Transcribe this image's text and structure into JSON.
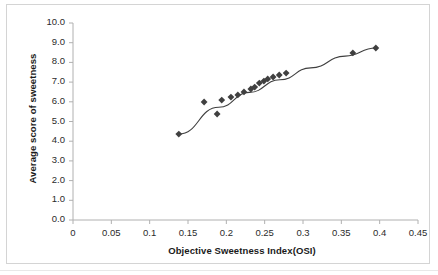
{
  "chart_data": {
    "type": "scatter",
    "title": "",
    "xlabel": "Objective Sweetness Index(OSI)",
    "ylabel": "Average score of sweetness",
    "xlim": [
      0,
      0.45
    ],
    "ylim": [
      0.0,
      10.0
    ],
    "xticks": [
      0,
      0.05,
      0.1,
      0.15,
      0.2,
      0.25,
      0.3,
      0.35,
      0.4,
      0.45
    ],
    "xtick_labels": [
      "0",
      "0.05",
      "0.1",
      "0.15",
      "0.2",
      "0.25",
      "0.3",
      "0.35",
      "0.4",
      "0.45"
    ],
    "yticks": [
      0,
      1,
      2,
      3,
      4,
      5,
      6,
      7,
      8,
      9,
      10
    ],
    "ytick_labels": [
      "0.0",
      "1.0",
      "2.0",
      "3.0",
      "4.0",
      "5.0",
      "6.0",
      "7.0",
      "8.0",
      "9.0",
      "10.0"
    ],
    "grid": false,
    "legend": false,
    "legend_position": "none",
    "marker": "diamond",
    "marker_color": "#404040",
    "trendline": {
      "visible": true,
      "style": "smooth-curve",
      "color": "#3f3f3f",
      "width": 1.1,
      "points": [
        {
          "x": 0.138,
          "y": 4.36
        },
        {
          "x": 0.19,
          "y": 5.72
        },
        {
          "x": 0.23,
          "y": 6.48
        },
        {
          "x": 0.27,
          "y": 7.12
        },
        {
          "x": 0.31,
          "y": 7.72
        },
        {
          "x": 0.355,
          "y": 8.32
        },
        {
          "x": 0.395,
          "y": 8.73
        }
      ]
    },
    "series": [
      {
        "name": "Sweetness",
        "points": [
          {
            "x": 0.138,
            "y": 4.36
          },
          {
            "x": 0.171,
            "y": 5.99
          },
          {
            "x": 0.188,
            "y": 5.38
          },
          {
            "x": 0.194,
            "y": 6.09
          },
          {
            "x": 0.206,
            "y": 6.24
          },
          {
            "x": 0.215,
            "y": 6.35
          },
          {
            "x": 0.223,
            "y": 6.5
          },
          {
            "x": 0.232,
            "y": 6.65
          },
          {
            "x": 0.237,
            "y": 6.75
          },
          {
            "x": 0.243,
            "y": 6.95
          },
          {
            "x": 0.249,
            "y": 7.05
          },
          {
            "x": 0.254,
            "y": 7.16
          },
          {
            "x": 0.261,
            "y": 7.26
          },
          {
            "x": 0.269,
            "y": 7.36
          },
          {
            "x": 0.278,
            "y": 7.46
          },
          {
            "x": 0.365,
            "y": 8.48
          },
          {
            "x": 0.395,
            "y": 8.73
          }
        ]
      }
    ],
    "colors": {
      "marker": "#404040",
      "trendline": "#3f3f3f",
      "axis": "#b0b0b0",
      "tick_text": "#2b2b2b",
      "frame_border": "#d4d4d4",
      "plot_background": "#ffffff"
    }
  }
}
